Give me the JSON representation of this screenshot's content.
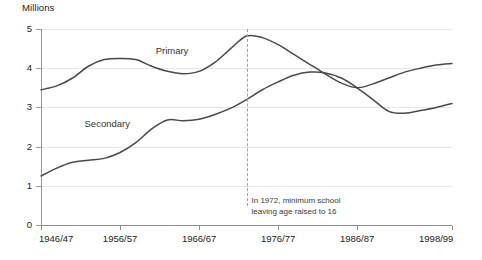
{
  "chart_data": {
    "type": "line",
    "title": "",
    "ylabel": "Millions",
    "xlabel": "",
    "ylim": [
      0,
      5
    ],
    "yticks": [
      0,
      1,
      2,
      3,
      4,
      5
    ],
    "ytick_labels": [
      "0",
      "1",
      "2",
      "3",
      "4",
      "5"
    ],
    "xlim": [
      1946,
      1998
    ],
    "xtick_labels": [
      "1946/47",
      "1956/57",
      "1966/67",
      "1976/77",
      "1986/87",
      "1998/99"
    ],
    "xtick_years": [
      1946,
      1956,
      1966,
      1976,
      1986,
      1998
    ],
    "grid": "horizontal",
    "legend": "inline-labels",
    "annotations": [
      {
        "name": "raising-of-school-leaving-age",
        "text": "In 1972, minimum school\nleaving age raised to 16",
        "year": 1972,
        "line_style": "dashed"
      }
    ],
    "series": [
      {
        "name": "Primary",
        "label": "Primary",
        "color": "#4a4a4a",
        "x": [
          1946,
          1948,
          1950,
          1952,
          1954,
          1956,
          1958,
          1960,
          1962,
          1964,
          1966,
          1968,
          1970,
          1972,
          1974,
          1976,
          1978,
          1980,
          1982,
          1984,
          1986,
          1988,
          1990,
          1992,
          1994,
          1996,
          1998
        ],
        "values": [
          3.45,
          3.55,
          3.75,
          4.05,
          4.22,
          4.25,
          4.22,
          4.05,
          3.92,
          3.86,
          3.92,
          4.15,
          4.5,
          4.82,
          4.78,
          4.6,
          4.35,
          4.1,
          3.85,
          3.62,
          3.5,
          3.6,
          3.75,
          3.9,
          4.0,
          4.08,
          4.12
        ]
      },
      {
        "name": "Secondary",
        "label": "Secondary",
        "color": "#4a4a4a",
        "x": [
          1946,
          1948,
          1950,
          1952,
          1954,
          1956,
          1958,
          1960,
          1962,
          1964,
          1966,
          1968,
          1970,
          1972,
          1974,
          1976,
          1978,
          1980,
          1982,
          1984,
          1986,
          1988,
          1990,
          1992,
          1994,
          1996,
          1998
        ],
        "values": [
          1.25,
          1.45,
          1.6,
          1.65,
          1.7,
          1.85,
          2.1,
          2.45,
          2.68,
          2.66,
          2.7,
          2.82,
          2.98,
          3.2,
          3.45,
          3.65,
          3.82,
          3.9,
          3.88,
          3.75,
          3.5,
          3.2,
          2.9,
          2.85,
          2.92,
          3.0,
          3.1
        ]
      }
    ]
  }
}
